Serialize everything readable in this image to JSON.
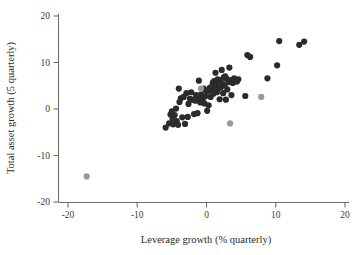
{
  "chart_data": {
    "type": "scatter",
    "title": "",
    "xlabel": "Leverage growth (% quarterly)",
    "ylabel": "Total asset growth (5 quarterly)",
    "xlim": [
      -20,
      20
    ],
    "ylim": [
      -20,
      20
    ],
    "xticks": [
      -20,
      -10,
      0,
      10,
      20
    ],
    "yticks": [
      -20,
      -10,
      0,
      10,
      20
    ],
    "xticklabels": [
      "-20",
      "-10",
      "0",
      "10",
      "20"
    ],
    "yticklabels": [
      "-20",
      "-10",
      "0",
      "10",
      "20"
    ],
    "grid": false,
    "legend": null,
    "colors": {
      "primary_marker": "#2b2b2b",
      "secondary_marker": "#9a9a9a",
      "axis": "#6e6e6e",
      "background": "#ffffff"
    },
    "marker_size": 3.1,
    "series": [
      {
        "name": "banks",
        "color": "#2b2b2b",
        "points": [
          [
            -5.9,
            -4.0
          ],
          [
            -5.4,
            -3.1
          ],
          [
            -5.2,
            -1.2
          ],
          [
            -5.0,
            -0.5
          ],
          [
            -4.9,
            -2.1
          ],
          [
            -4.8,
            -3.3
          ],
          [
            -4.6,
            -1.3
          ],
          [
            -4.4,
            0.1
          ],
          [
            -4.3,
            -2.6
          ],
          [
            -4.1,
            -3.4
          ],
          [
            -4.0,
            4.4
          ],
          [
            -3.9,
            1.5
          ],
          [
            -3.7,
            2.3
          ],
          [
            -3.5,
            -1.8
          ],
          [
            -3.3,
            2.6
          ],
          [
            -3.1,
            -3.2
          ],
          [
            -2.9,
            3.4
          ],
          [
            -2.7,
            -1.7
          ],
          [
            -2.6,
            1.1
          ],
          [
            -2.4,
            2.2
          ],
          [
            -2.2,
            3.6
          ],
          [
            -2.0,
            2.0
          ],
          [
            -1.8,
            -1.1
          ],
          [
            -1.6,
            1.8
          ],
          [
            -1.5,
            3.0
          ],
          [
            -1.3,
            -0.9
          ],
          [
            -1.2,
            2.4
          ],
          [
            -1.1,
            6.1
          ],
          [
            -0.9,
            1.4
          ],
          [
            -0.8,
            3.1
          ],
          [
            -0.6,
            2.0
          ],
          [
            -0.4,
            4.4
          ],
          [
            -0.3,
            1.2
          ],
          [
            -0.2,
            2.7
          ],
          [
            -0.1,
            4.0
          ],
          [
            0.1,
            -0.4
          ],
          [
            0.2,
            3.8
          ],
          [
            0.3,
            0.8
          ],
          [
            0.5,
            4.6
          ],
          [
            0.6,
            2.6
          ],
          [
            0.8,
            4.1
          ],
          [
            0.9,
            5.6
          ],
          [
            1.0,
            3.3
          ],
          [
            1.1,
            6.0
          ],
          [
            1.2,
            4.8
          ],
          [
            1.3,
            7.8
          ],
          [
            1.4,
            5.2
          ],
          [
            1.5,
            3.6
          ],
          [
            1.6,
            6.4
          ],
          [
            1.7,
            4.4
          ],
          [
            1.8,
            5.9
          ],
          [
            1.9,
            2.1
          ],
          [
            2.0,
            6.2
          ],
          [
            2.1,
            4.7
          ],
          [
            2.2,
            8.4
          ],
          [
            2.3,
            5.4
          ],
          [
            2.4,
            3.4
          ],
          [
            2.5,
            6.8
          ],
          [
            2.6,
            5.1
          ],
          [
            2.7,
            7.0
          ],
          [
            2.8,
            2.0
          ],
          [
            2.9,
            6.5
          ],
          [
            3.0,
            4.2
          ],
          [
            3.2,
            5.8
          ],
          [
            3.3,
            8.9
          ],
          [
            3.5,
            6.2
          ],
          [
            3.6,
            3.0
          ],
          [
            3.8,
            5.6
          ],
          [
            4.0,
            6.6
          ],
          [
            4.2,
            6.0
          ],
          [
            4.4,
            5.9
          ],
          [
            4.6,
            6.4
          ],
          [
            5.6,
            2.8
          ],
          [
            5.9,
            11.6
          ],
          [
            6.3,
            11.2
          ],
          [
            8.8,
            6.6
          ],
          [
            10.2,
            9.4
          ],
          [
            10.5,
            14.6
          ],
          [
            13.4,
            13.8
          ],
          [
            14.1,
            14.5
          ]
        ]
      },
      {
        "name": "highlighted",
        "color": "#9a9a9a",
        "points": [
          [
            -17.3,
            -14.5
          ],
          [
            -0.8,
            4.4
          ],
          [
            3.4,
            -3.1
          ],
          [
            7.9,
            2.6
          ]
        ]
      }
    ]
  }
}
